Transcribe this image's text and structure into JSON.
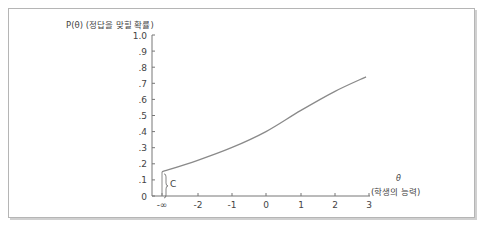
{
  "chart_data": {
    "type": "line",
    "title": "P(θ) (정답을 맞힐 확률)",
    "ylabel": "P(θ) (정답을 맞힐 확률)",
    "xlabel": "θ (학생의 능력)",
    "x_symbol": "θ",
    "x_caption": "(학생의 능력)",
    "ylim": [
      0,
      1.0
    ],
    "xlim": [
      "-∞",
      3
    ],
    "grid": false,
    "legend": null,
    "y_ticks": [
      "0",
      ".1",
      ".2",
      ".3",
      ".4",
      ".5",
      ".6",
      ".7",
      ".8",
      ".9",
      "1.0"
    ],
    "x_ticks": [
      "-∞",
      "-2",
      "-1",
      "0",
      "1",
      "2",
      "3"
    ],
    "annotation": {
      "label": "C",
      "meaning": "lower asymptote (guessing parameter)",
      "value": 0.15
    },
    "series": [
      {
        "name": "Item characteristic curve",
        "x": [
          "-∞",
          -2,
          -1,
          0,
          1,
          2,
          2.9
        ],
        "y": [
          0.15,
          0.22,
          0.3,
          0.4,
          0.53,
          0.65,
          0.74
        ]
      }
    ]
  }
}
